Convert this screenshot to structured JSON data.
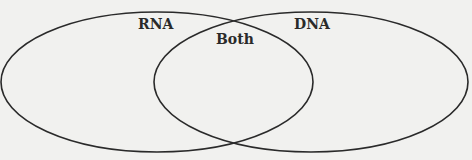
{
  "diagram": {
    "type": "venn",
    "sets": [
      {
        "id": "left",
        "label": "RNA",
        "ellipse": {
          "cx": 157,
          "cy": 82,
          "rx": 156,
          "ry": 70
        }
      },
      {
        "id": "right",
        "label": "DNA",
        "ellipse": {
          "cx": 311,
          "cy": 82,
          "rx": 157,
          "ry": 70
        }
      }
    ],
    "intersection": {
      "label": "Both"
    },
    "colors": {
      "background": "#f1f1ef",
      "stroke": "#2a2a2a",
      "text": "#2a2a2a"
    }
  }
}
